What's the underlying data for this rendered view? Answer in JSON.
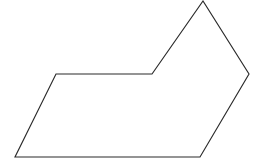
{
  "canvas": {
    "width": 261,
    "height": 163,
    "background_color": "#ffffff",
    "description": "line-drawing-polygon"
  },
  "shape": {
    "name": "concave-hexagon-outline",
    "type": "polygon",
    "vertex_count": 6,
    "fill_color": "none",
    "stroke_color": "#2b2b2b",
    "stroke_width": 1.15,
    "closed": true,
    "vertices": [
      {
        "label": "ledge-top-left",
        "x": 56,
        "y": 74
      },
      {
        "label": "inner-notch",
        "x": 152,
        "y": 74
      },
      {
        "label": "top-apex",
        "x": 203,
        "y": 1
      },
      {
        "label": "right-vertex",
        "x": 249,
        "y": 74
      },
      {
        "label": "bottom-right",
        "x": 200,
        "y": 157
      },
      {
        "label": "bottom-left",
        "x": 15,
        "y": 157
      }
    ],
    "points_attr": "56,74 152,74 203,1 249,74 200,157 15,157"
  }
}
